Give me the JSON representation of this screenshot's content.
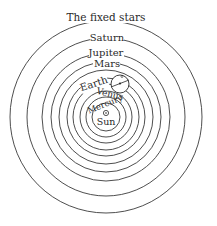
{
  "diagram": {
    "center": {
      "x": 106,
      "y": 117
    },
    "labels": {
      "fixed_stars": "The fixed stars",
      "saturn": "Saturn",
      "jupiter": "Jupiter",
      "mars": "Mars",
      "earth": "Earth",
      "venus": "Venus",
      "mercury": "Mercury",
      "sun": "Sun"
    },
    "sun_symbol": "⊙",
    "orbit_radii": [
      96,
      79,
      64,
      55,
      47,
      40,
      33,
      26,
      20,
      14
    ],
    "colors": {
      "line": "#3a3a3a",
      "text": "#2a2a2a",
      "background": "#ffffff"
    }
  }
}
